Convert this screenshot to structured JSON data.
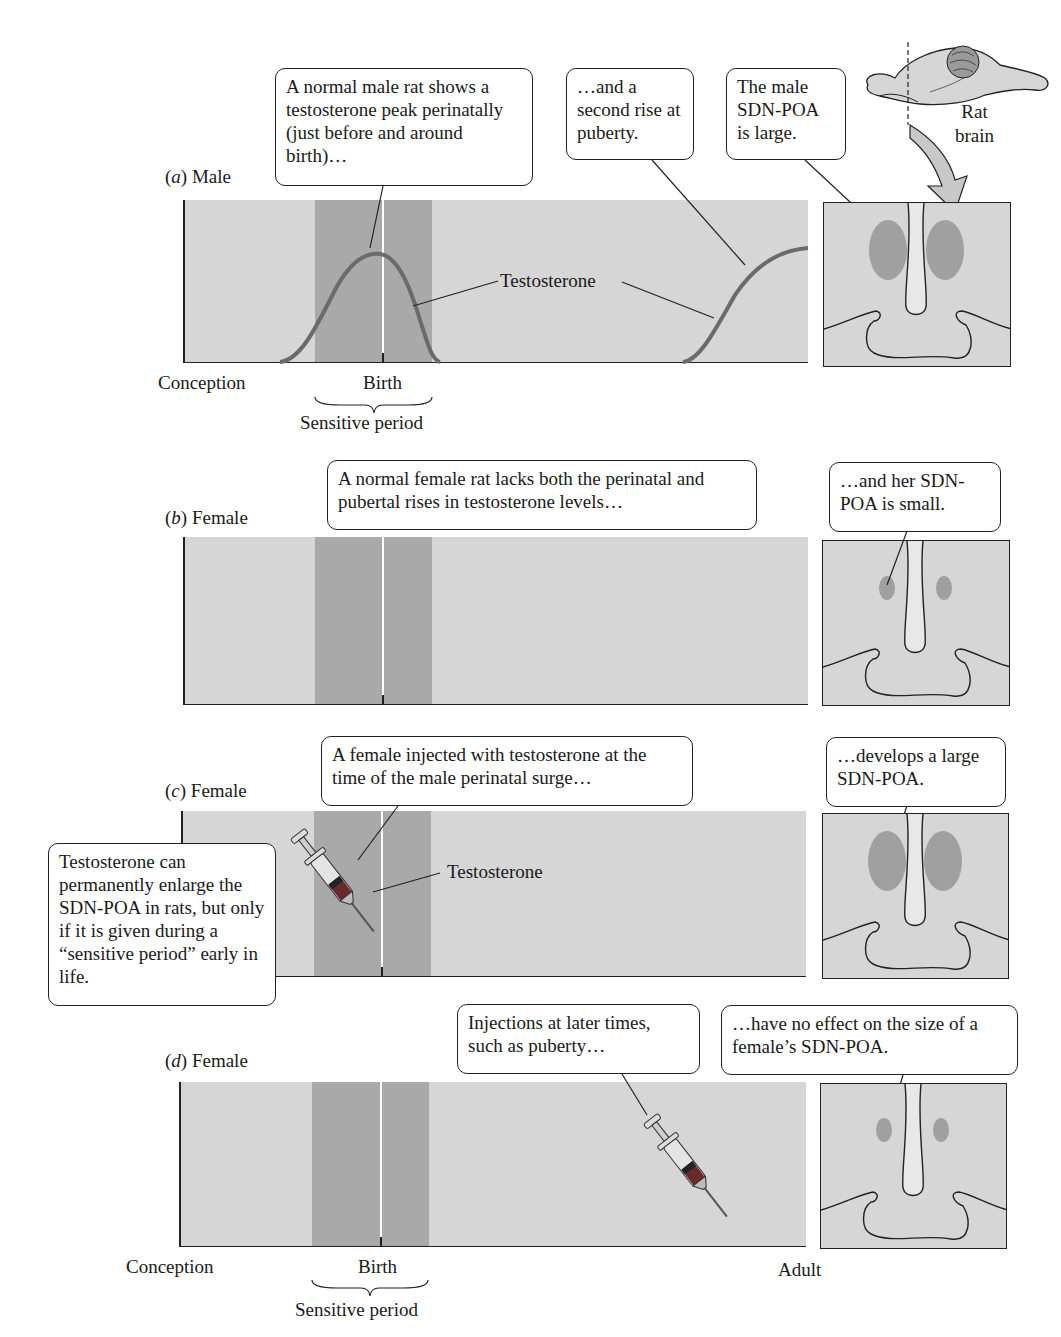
{
  "figure": {
    "colors": {
      "panel_background": "#d6d6d6",
      "sensitive_period_band": "#a9a9a9",
      "testosterone_curve": "#6b6b6b",
      "sdn_poa_nucleus": "#a0a0a0",
      "outline": "#222222"
    },
    "rat_brain": {
      "label_line1": "Rat",
      "label_line2": "brain"
    },
    "axis": {
      "start_label": "Conception",
      "birth_label": "Birth",
      "end_label": "Adult",
      "sensitive_period_label": "Sensitive period"
    },
    "panels": [
      {
        "id": "a",
        "letter": "a",
        "sex": "Male",
        "callouts": [
          "A normal male rat shows a testosterone peak perinatally (just before and around birth)…",
          "…and a second rise at puberty.",
          "The male SDN-POA is large."
        ],
        "curve_label": "Testosterone",
        "sdn_poa_size": "large"
      },
      {
        "id": "b",
        "letter": "b",
        "sex": "Female",
        "callouts": [
          "A normal female rat lacks both the perinatal and pubertal rises in testosterone levels…",
          "…and her SDN-POA is small."
        ],
        "sdn_poa_size": "small"
      },
      {
        "id": "c",
        "letter": "c",
        "sex": "Female",
        "callouts": [
          "A female injected with testosterone at the time of the male perinatal surge…",
          "…develops a large SDN-POA."
        ],
        "syringe_label": "Testosterone",
        "side_note": "Testosterone can permanently enlarge the SDN-POA in rats, but only if it is given during a “sensitive period” early in life.",
        "sdn_poa_size": "large"
      },
      {
        "id": "d",
        "letter": "d",
        "sex": "Female",
        "callouts": [
          "Injections at later times, such as puberty…",
          "…have no effect on the size of a female’s SDN-POA."
        ],
        "sdn_poa_size": "small"
      }
    ]
  }
}
